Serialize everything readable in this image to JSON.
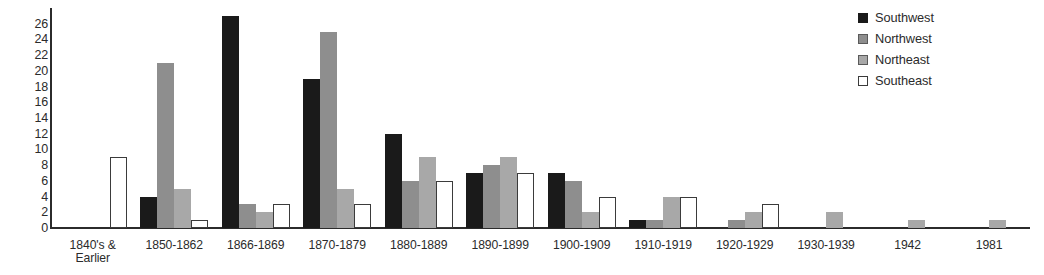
{
  "chart_data": {
    "type": "bar",
    "title": "",
    "subtitle": "",
    "xlabel": "",
    "ylabel": "",
    "ylim": [
      0,
      28
    ],
    "y_ticks": [
      0,
      2,
      4,
      6,
      8,
      10,
      12,
      14,
      16,
      18,
      20,
      22,
      24,
      26
    ],
    "grid": false,
    "legend_position": "top-right",
    "categories": [
      "1840's &\nEarlier",
      "1850-1862",
      "1866-1869",
      "1870-1879",
      "1880-1889",
      "1890-1899",
      "1900-1909",
      "1910-1919",
      "1920-1929",
      "1930-1939",
      "1942",
      "1981"
    ],
    "series": [
      {
        "name": "Southwest",
        "color": "#1a1a1a",
        "values": [
          0,
          4,
          27,
          19,
          12,
          7,
          7,
          1,
          0,
          0,
          0,
          0
        ]
      },
      {
        "name": "Northwest",
        "color": "#8e8e8e",
        "values": [
          0,
          21,
          3,
          25,
          6,
          8,
          6,
          1,
          1,
          0,
          0,
          0
        ]
      },
      {
        "name": "Northeast",
        "color": "#a8a8a8",
        "values": [
          0,
          5,
          2,
          5,
          9,
          9,
          2,
          4,
          2,
          2,
          1,
          1
        ]
      },
      {
        "name": "Southeast",
        "color": "#ffffff",
        "values": [
          9,
          1,
          3,
          3,
          6,
          7,
          4,
          4,
          3,
          0,
          0,
          0
        ]
      }
    ]
  },
  "legend": {
    "items": [
      {
        "label": "Southwest",
        "swatch": "legend-swatch-southwest"
      },
      {
        "label": "Northwest",
        "swatch": "legend-swatch-northwest"
      },
      {
        "label": "Northeast",
        "swatch": "legend-swatch-northeast"
      },
      {
        "label": "Southeast",
        "swatch": "legend-swatch-southeast"
      }
    ]
  }
}
